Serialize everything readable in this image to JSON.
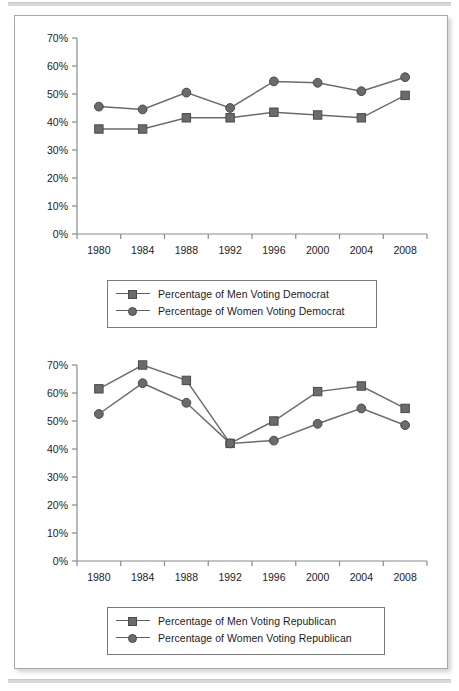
{
  "figure": {
    "background_color": "#ffffff",
    "border_color": "#a8a8a8",
    "series_color": "#6b6b6b",
    "axis_color": "#8a8a8a",
    "text_color": "#1c1c1c"
  },
  "chart_data": [
    {
      "type": "line",
      "title": "",
      "xlabel": "",
      "ylabel": "",
      "categories": [
        "1980",
        "1984",
        "1988",
        "1992",
        "1996",
        "2000",
        "2004",
        "2008"
      ],
      "x": [
        1980,
        1984,
        1988,
        1992,
        1996,
        2000,
        2004,
        2008
      ],
      "ylim": [
        0,
        70
      ],
      "yticks": [
        0,
        10,
        20,
        30,
        40,
        50,
        60,
        70
      ],
      "ytick_labels": [
        "0%",
        "10%",
        "20%",
        "30%",
        "40%",
        "50%",
        "60%",
        "70%"
      ],
      "grid": false,
      "legend_position": "bottom",
      "series": [
        {
          "name": "Percentage of Men Voting Democrat",
          "marker": "square",
          "values": [
            37.5,
            37.5,
            41.5,
            41.5,
            43.5,
            42.5,
            41.5,
            49.5
          ]
        },
        {
          "name": "Percentage of Women Voting Democrat",
          "marker": "circle",
          "values": [
            45.5,
            44.5,
            50.5,
            45.0,
            54.5,
            54.0,
            51.0,
            56.0
          ]
        }
      ]
    },
    {
      "type": "line",
      "title": "",
      "xlabel": "",
      "ylabel": "",
      "categories": [
        "1980",
        "1984",
        "1988",
        "1992",
        "1996",
        "2000",
        "2004",
        "2008"
      ],
      "x": [
        1980,
        1984,
        1988,
        1992,
        1996,
        2000,
        2004,
        2008
      ],
      "ylim": [
        0,
        70
      ],
      "yticks": [
        0,
        10,
        20,
        30,
        40,
        50,
        60,
        70
      ],
      "ytick_labels": [
        "0%",
        "10%",
        "20%",
        "30%",
        "40%",
        "50%",
        "60%",
        "70%"
      ],
      "grid": false,
      "legend_position": "bottom",
      "series": [
        {
          "name": "Percentage of Men Voting Republican",
          "marker": "square",
          "values": [
            61.5,
            70.0,
            64.5,
            42.0,
            50.0,
            60.5,
            62.5,
            54.5
          ]
        },
        {
          "name": "Percentage of Women Voting Republican",
          "marker": "circle",
          "values": [
            52.5,
            63.5,
            56.5,
            42.0,
            43.0,
            49.0,
            54.5,
            48.5
          ]
        }
      ]
    }
  ]
}
